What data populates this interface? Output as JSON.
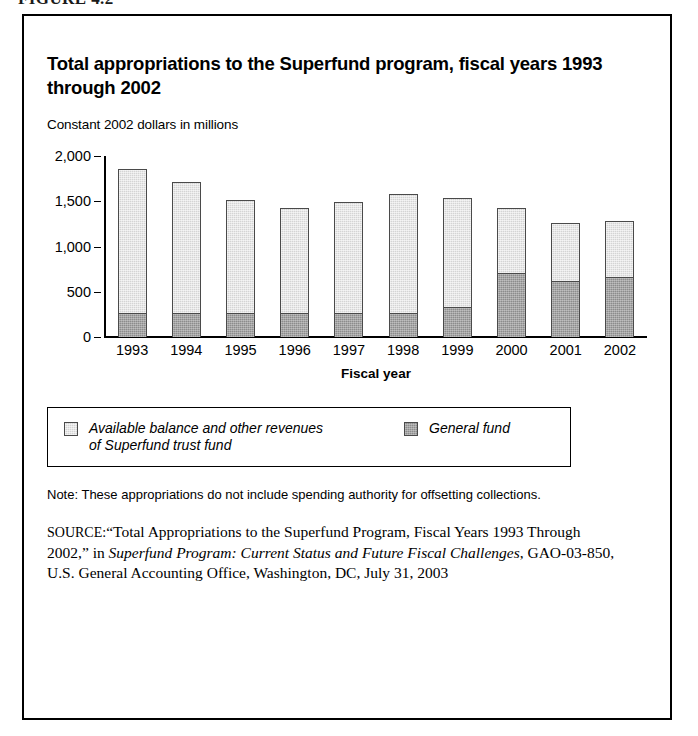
{
  "figure_caption": "FIGURE 4.2",
  "chart": {
    "title": "Total appropriations to the Superfund program, fiscal years 1993 through 2002",
    "subtitle": "Constant 2002 dollars in millions"
  },
  "legend": {
    "items": [
      {
        "label": "Available balance and other revenues\nof Superfund trust fund",
        "swatch": "light-gray-swatch",
        "color": "#d4d4d4"
      },
      {
        "label": "General fund",
        "swatch": "dark-gray-swatch",
        "color": "#8c8c8c"
      }
    ]
  },
  "note": "Note: These appropriations do not include spending authority for offsetting collections.",
  "source": {
    "label": "SOURCE:",
    "text_1": "“Total Appropriations to the Superfund Program, Fiscal Years 1993 Through 2002,” in ",
    "italic_title": "Superfund Program: Current Status and Future Fiscal Challenges",
    "text_2": ", GAO-03-850, U.S. General Accounting Office, Washington, DC, July 31, 2003"
  },
  "chart_data": {
    "type": "bar",
    "stacked": true,
    "title": "Total appropriations to the Superfund program, fiscal years 1993 through 2002",
    "subtitle": "Constant 2002 dollars in millions",
    "xlabel": "Fiscal year",
    "ylabel": "",
    "ylim": [
      0,
      2000
    ],
    "yticks": [
      0,
      500,
      1000,
      1500,
      2000
    ],
    "ytick_labels": [
      "0",
      "500",
      "1,000",
      "1,500",
      "2,000"
    ],
    "grid": false,
    "legend_position": "below-plot",
    "categories": [
      "1993",
      "1994",
      "1995",
      "1996",
      "1997",
      "1998",
      "1999",
      "2000",
      "2001",
      "2002"
    ],
    "series": [
      {
        "name": "General fund",
        "color": "#8c8c8c",
        "values": [
          270,
          270,
          270,
          265,
          265,
          270,
          330,
          705,
          620,
          665
        ]
      },
      {
        "name": "Available balance and other revenues of Superfund trust fund",
        "color": "#d4d4d4",
        "values": [
          1585,
          1440,
          1240,
          1160,
          1230,
          1310,
          1210,
          725,
          635,
          620
        ]
      }
    ],
    "totals": [
      1855,
      1710,
      1510,
      1425,
      1495,
      1580,
      1540,
      1430,
      1255,
      1285
    ]
  }
}
